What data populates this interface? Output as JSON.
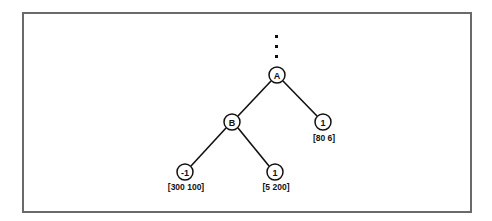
{
  "diagram": {
    "type": "game-tree",
    "ellipsis": {
      "x": 276,
      "dots_y": [
        36,
        46,
        56
      ]
    },
    "nodes": [
      {
        "id": "A",
        "label": "A",
        "x": 277,
        "y": 75,
        "value": ""
      },
      {
        "id": "B",
        "label": "B",
        "x": 232,
        "y": 122,
        "value": ""
      },
      {
        "id": "R",
        "label": "1",
        "x": 323,
        "y": 122,
        "value": "[80 6]"
      },
      {
        "id": "LL",
        "label": "-1",
        "x": 185,
        "y": 172,
        "value": "[300 100]"
      },
      {
        "id": "LR",
        "label": "1",
        "x": 275,
        "y": 172,
        "value": "[5 200]"
      }
    ],
    "edges": [
      {
        "from": "A",
        "to": "B"
      },
      {
        "from": "A",
        "to": "R"
      },
      {
        "from": "B",
        "to": "LL"
      },
      {
        "from": "B",
        "to": "LR"
      }
    ],
    "colors": {
      "stroke": "#111111",
      "frame": "#6a6a6a",
      "background": "#ffffff"
    }
  }
}
